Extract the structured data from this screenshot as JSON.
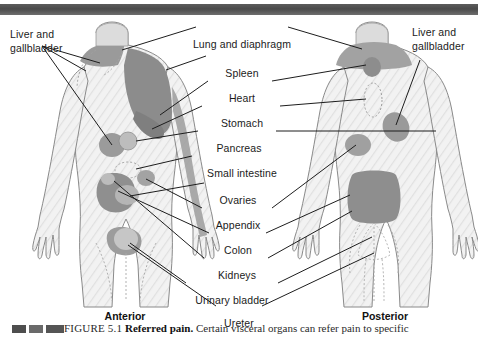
{
  "figure": {
    "number_text": "FIGURE 5.1",
    "title": "Referred pain.",
    "caption_rest": " Certain visceral organs can refer pain to specific"
  },
  "orientation": {
    "anterior": "Anterior",
    "posterior": "Posterior"
  },
  "corner_labels": {
    "left": "Liver and gallbladder",
    "right": "Liver and gallbladder"
  },
  "center_labels": [
    {
      "text": "Lung and diaphragm",
      "y": 12
    },
    {
      "text": "Spleen",
      "y": 41
    },
    {
      "text": "Heart",
      "y": 66
    },
    {
      "text": "Stomach",
      "y": 91
    },
    {
      "text": "Pancreas",
      "y": 116
    },
    {
      "text": "Small intestine",
      "y": 141
    },
    {
      "text": "Ovaries",
      "y": 168
    },
    {
      "text": "Appendix",
      "y": 193
    },
    {
      "text": "Colon",
      "y": 218
    },
    {
      "text": "Kidneys",
      "y": 243
    },
    {
      "text": "Urinary bladder",
      "y": 268
    },
    {
      "text": "Ureter",
      "y": 291
    }
  ],
  "colors": {
    "shade_dark": "#8c8c8c",
    "shade_mid": "#a6a6a6",
    "shade_light": "#c3c3c3",
    "body_fill": "#efefef",
    "outline": "#7a7a7a",
    "leader": "#1d1d1d",
    "topbar": "#555555"
  },
  "regions": {
    "anterior": [
      "lung-and-diaphragm-shoulder",
      "spleen-upper-left",
      "heart-chest",
      "stomach-epigastric",
      "liver-gallbladder-right-upper",
      "pancreas-mid",
      "small-intestine-periumbilical",
      "appendix-right-lower",
      "colon-lower-abdomen",
      "ovaries-pelvic",
      "urinary-bladder-suprapubic"
    ],
    "posterior": [
      "lung-and-diaphragm-shoulders",
      "heart-upper-back",
      "stomach-midline-back",
      "liver-gallbladder-right-scapular",
      "kidneys-flank",
      "colon-lumbar-broad",
      "ureter-gluteal-midline"
    ]
  }
}
